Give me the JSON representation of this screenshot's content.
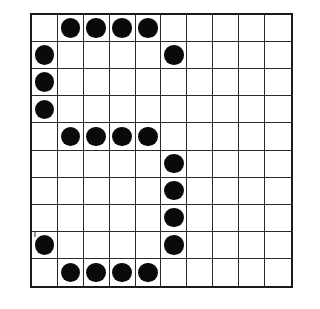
{
  "figure": {
    "kind": "dot-grid-pattern",
    "title": "",
    "caption": "",
    "background_color": "#ffffff",
    "grid_line_color": "#2b2b2b",
    "border_color": "#1a1a1a",
    "dot_color": "#0a0a0a"
  },
  "grid": {
    "rows": 10,
    "columns": 10,
    "row_labels": [
      "1",
      "2",
      "3",
      "4",
      "5",
      "6",
      "7",
      "8",
      "9",
      "10"
    ],
    "column_labels": [
      "1",
      "2",
      "3",
      "4",
      "5",
      "6",
      "7",
      "8",
      "9",
      "10"
    ],
    "dot_count": 20,
    "filled_cells": [
      {
        "row": 1,
        "col": 2
      },
      {
        "row": 1,
        "col": 3
      },
      {
        "row": 1,
        "col": 4
      },
      {
        "row": 1,
        "col": 5
      },
      {
        "row": 2,
        "col": 1
      },
      {
        "row": 2,
        "col": 6
      },
      {
        "row": 3,
        "col": 1
      },
      {
        "row": 4,
        "col": 1
      },
      {
        "row": 5,
        "col": 2
      },
      {
        "row": 5,
        "col": 3
      },
      {
        "row": 5,
        "col": 4
      },
      {
        "row": 5,
        "col": 5
      },
      {
        "row": 6,
        "col": 6
      },
      {
        "row": 7,
        "col": 6
      },
      {
        "row": 8,
        "col": 6
      },
      {
        "row": 9,
        "col": 1
      },
      {
        "row": 9,
        "col": 6
      },
      {
        "row": 10,
        "col": 2
      },
      {
        "row": 10,
        "col": 3
      },
      {
        "row": 10,
        "col": 4
      },
      {
        "row": 10,
        "col": 5
      }
    ],
    "matrix": [
      [
        0,
        1,
        1,
        1,
        1,
        0,
        0,
        0,
        0,
        0
      ],
      [
        1,
        0,
        0,
        0,
        0,
        1,
        0,
        0,
        0,
        0
      ],
      [
        1,
        0,
        0,
        0,
        0,
        0,
        0,
        0,
        0,
        0
      ],
      [
        1,
        0,
        0,
        0,
        0,
        0,
        0,
        0,
        0,
        0
      ],
      [
        0,
        1,
        1,
        1,
        1,
        0,
        0,
        0,
        0,
        0
      ],
      [
        0,
        0,
        0,
        0,
        0,
        1,
        0,
        0,
        0,
        0
      ],
      [
        0,
        0,
        0,
        0,
        0,
        1,
        0,
        0,
        0,
        0
      ],
      [
        0,
        0,
        0,
        0,
        0,
        1,
        0,
        0,
        0,
        0
      ],
      [
        1,
        0,
        0,
        0,
        0,
        1,
        0,
        0,
        0,
        0
      ],
      [
        0,
        1,
        1,
        1,
        1,
        0,
        0,
        0,
        0,
        0
      ]
    ]
  }
}
